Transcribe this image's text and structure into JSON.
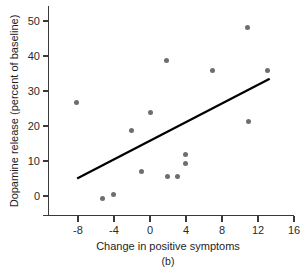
{
  "chart_data": {
    "type": "scatter",
    "title": "",
    "caption": "(b)",
    "xlabel": "Change in positive symptoms",
    "ylabel": "Dopamine release (percent of baseline)",
    "xlim": [
      -11.5,
      17.5
    ],
    "ylim": [
      -5.5,
      55.5
    ],
    "xticks": [
      -8,
      -4,
      0,
      4,
      8,
      12,
      16
    ],
    "xtick_labels": [
      "-8",
      "-4",
      "0",
      "4",
      "8",
      "12",
      "16"
    ],
    "yticks": [
      0,
      10,
      20,
      30,
      40,
      50
    ],
    "ytick_labels": [
      "0",
      "10",
      "20",
      "30",
      "40",
      "50"
    ],
    "grid": false,
    "legend": null,
    "marker_color": "#6e6e6e",
    "line_color": "#000000",
    "axis_color": "#3a3a3a",
    "points": [
      {
        "x": -8.2,
        "y": 26.6
      },
      {
        "x": -5.3,
        "y": -0.6
      },
      {
        "x": -4.1,
        "y": 0.3
      },
      {
        "x": -2.1,
        "y": 18.6
      },
      {
        "x": -1.0,
        "y": 7.0
      },
      {
        "x": 0.0,
        "y": 23.8
      },
      {
        "x": 1.8,
        "y": 38.8
      },
      {
        "x": 1.9,
        "y": 5.7
      },
      {
        "x": 3.0,
        "y": 5.7
      },
      {
        "x": 3.9,
        "y": 11.9
      },
      {
        "x": 3.9,
        "y": 9.3
      },
      {
        "x": 6.9,
        "y": 35.8
      },
      {
        "x": 10.8,
        "y": 48.2
      },
      {
        "x": 10.9,
        "y": 21.4
      },
      {
        "x": 13.0,
        "y": 36.0
      }
    ],
    "trendline": {
      "x0": -8.1,
      "y0": 5.0,
      "x1": 13.3,
      "y1": 33.5
    }
  }
}
